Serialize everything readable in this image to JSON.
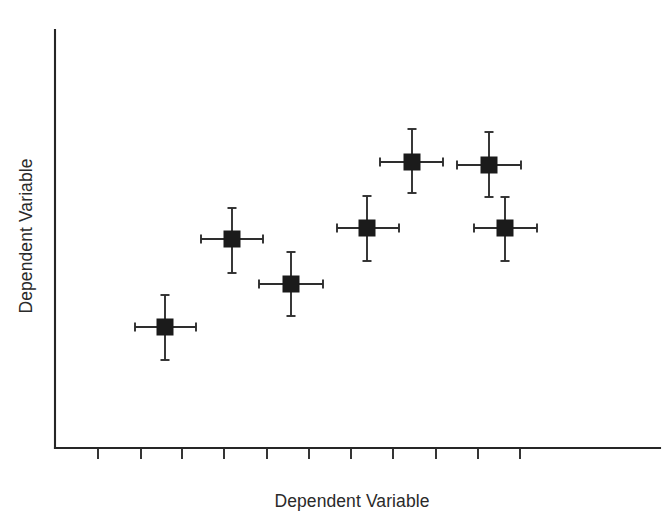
{
  "chart_data": {
    "type": "scatter",
    "title": "",
    "xlabel": "Dependent Variable",
    "ylabel": "Dependent Variable",
    "grid": false,
    "legend": null,
    "xlim": [
      0,
      11
    ],
    "ylim": [
      0,
      10
    ],
    "x_tick_labels": [
      "",
      "",
      "",
      "",
      "",
      "",
      "",
      "",
      "",
      "",
      ""
    ],
    "y_tick_labels": [],
    "n_x_ticks": 11,
    "n_y_ticks": 0,
    "marker": "filled-square",
    "error_bars": "both-x-and-y",
    "points": [
      {
        "id": "p1",
        "x": 1.45,
        "y": 2.45,
        "xerr_low": 0.65,
        "xerr_high": 0.67,
        "yerr_low": 0.74,
        "yerr_high": 0.73
      },
      {
        "id": "p2",
        "x": 3.05,
        "y": 4.55,
        "xerr_low": 0.67,
        "xerr_high": 0.67,
        "yerr_low": 0.73,
        "yerr_high": 0.7
      },
      {
        "id": "p3",
        "x": 4.35,
        "y": 3.7,
        "xerr_low": 0.7,
        "xerr_high": 0.7,
        "yerr_low": 0.72,
        "yerr_high": 0.72
      },
      {
        "id": "p4",
        "x": 6.05,
        "y": 5.0,
        "xerr_low": 0.66,
        "xerr_high": 0.7,
        "yerr_low": 0.73,
        "yerr_high": 0.72
      },
      {
        "id": "p5",
        "x": 7.05,
        "y": 6.65,
        "xerr_low": 0.7,
        "xerr_high": 0.68,
        "yerr_low": 0.72,
        "yerr_high": 0.73
      },
      {
        "id": "p6",
        "x": 8.75,
        "y": 6.6,
        "xerr_low": 0.7,
        "xerr_high": 0.7,
        "yerr_low": 0.73,
        "yerr_high": 0.74
      },
      {
        "id": "p7",
        "x": 9.1,
        "y": 5.0,
        "xerr_low": 0.68,
        "xerr_high": 0.7,
        "yerr_low": 0.72,
        "yerr_high": 0.74
      }
    ],
    "pixel_geometry": {
      "axis_origin": [
        55,
        448
      ],
      "y_axis_top": [
        55,
        30
      ],
      "x_axis_right": [
        660,
        448
      ],
      "tick_x_positions": [
        98,
        141,
        182,
        224,
        267,
        309,
        351,
        393,
        436,
        478,
        520
      ],
      "tick_length": 11,
      "marker_size": 16,
      "points_px": [
        {
          "id": "p1",
          "cx": 165,
          "cy": 327,
          "x_lo": 135,
          "x_hi": 196,
          "y_lo": 295,
          "y_hi": 360
        },
        {
          "id": "p2",
          "cx": 232,
          "cy": 239,
          "x_lo": 201,
          "x_hi": 263,
          "y_lo": 208,
          "y_hi": 273
        },
        {
          "id": "p3",
          "cx": 291,
          "cy": 284,
          "x_lo": 259,
          "x_hi": 323,
          "y_lo": 252,
          "y_hi": 316
        },
        {
          "id": "p4",
          "cx": 367,
          "cy": 228,
          "x_lo": 337,
          "x_hi": 399,
          "y_lo": 196,
          "y_hi": 261
        },
        {
          "id": "p5",
          "cx": 412,
          "cy": 162,
          "x_lo": 380,
          "x_hi": 443,
          "y_lo": 129,
          "y_hi": 193
        },
        {
          "id": "p6",
          "cx": 489,
          "cy": 165,
          "x_lo": 457,
          "x_hi": 521,
          "y_lo": 132,
          "y_hi": 197
        },
        {
          "id": "p7",
          "cx": 505,
          "cy": 228,
          "x_lo": 474,
          "x_hi": 537,
          "y_lo": 197,
          "y_hi": 261
        }
      ]
    },
    "colors": {
      "marker": "#1b1b1b",
      "axis": "#262626",
      "error_bar": "#2e2e2e",
      "label_text": "#2a2a2a",
      "background": "#ffffff"
    }
  }
}
